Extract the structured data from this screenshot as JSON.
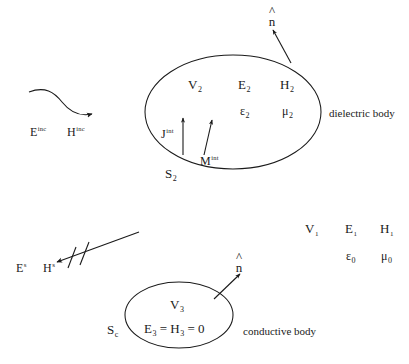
{
  "figure": {
    "background_color": "#ffffff",
    "stroke_color": "#1a1a1a",
    "width": 409,
    "height": 364
  },
  "dielectric_region": {
    "volume_label": "V",
    "volume_sub": "2",
    "e_field": "E",
    "e_sub": "2",
    "h_field": "H",
    "h_sub": "2",
    "permittivity": "ε",
    "permittivity_sub": "2",
    "permeability": "μ",
    "permeability_sub": "2",
    "surface_label": "S",
    "surface_sub": "2",
    "equivalent_electric_current": "J",
    "equivalent_electric_current_sup": "int",
    "equivalent_magnetic_current": "M",
    "equivalent_magnetic_current_sup": "int",
    "normal_vector": "n",
    "body_caption": "dielectric body"
  },
  "conductive_region": {
    "volume_label": "V",
    "volume_sub": "3",
    "null_field_expression": "E",
    "null_field_sub_1": "3",
    "null_field_eq_1": " = ",
    "null_field_h": "H",
    "null_field_sub_2": "3",
    "null_field_eq_2": " = 0",
    "surface_label": "S",
    "surface_sub": "c",
    "normal_vector": "n",
    "body_caption": "conductive body"
  },
  "exterior_region": {
    "volume_label": "V",
    "volume_sub": "1",
    "e_field": "E",
    "e_sub": "1",
    "h_field": "H",
    "h_sub": "1",
    "permittivity": "ε",
    "permittivity_sub": "0",
    "permeability": "μ",
    "permeability_sub": "0"
  },
  "incident_field": {
    "e_field": "E",
    "e_sup": "inc",
    "h_field": "H",
    "h_sup": "inc"
  },
  "scattered_field": {
    "e_field": "E",
    "e_sup": "s",
    "h_field": "H",
    "h_sup": "s"
  }
}
